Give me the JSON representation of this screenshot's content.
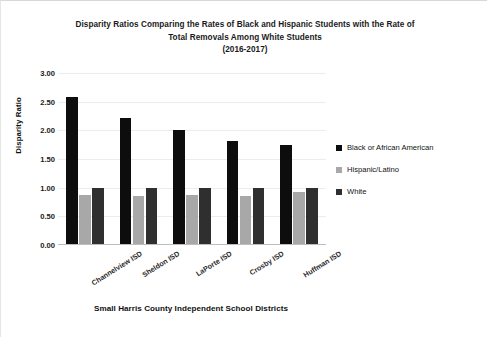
{
  "chart_data": {
    "type": "bar",
    "title": "Disparity Ratios Comparing the Rates of Black and Hispanic Students with the Rate of Total Removals Among White Students (2016-2017)",
    "title_lines": [
      "Disparity Ratios Comparing the Rates of Black and Hispanic Students with the Rate of",
      "Total Removals Among White Students",
      "(2016-2017)"
    ],
    "xlabel": "Small Harris County Independent School Districts",
    "ylabel": "Disparity Ratio",
    "ylim": [
      0.0,
      3.0
    ],
    "ytick_step": 0.5,
    "ytick_labels": [
      "0.00",
      "0.50",
      "1.00",
      "1.50",
      "2.00",
      "2.50",
      "3.00"
    ],
    "ytick_values": [
      0.0,
      0.5,
      1.0,
      1.5,
      2.0,
      2.5,
      3.0
    ],
    "grid": true,
    "legend_position": "right",
    "categories": [
      "Channelview ISD",
      "Sheldon ISD",
      "LaPorte ISD",
      "Crosby ISD",
      "Huffman ISD"
    ],
    "series": [
      {
        "name": "Black or African American",
        "color": "#0d0d0d",
        "values": [
          2.58,
          2.22,
          2.01,
          1.82,
          1.75
        ]
      },
      {
        "name": "Hispanic/Latino",
        "color": "#a8a8a8",
        "values": [
          0.87,
          0.85,
          0.88,
          0.85,
          0.92
        ]
      },
      {
        "name": "White",
        "color": "#2f2f2f",
        "values": [
          1.0,
          1.0,
          1.0,
          1.0,
          1.0
        ]
      }
    ]
  },
  "colors": {
    "series_black": "#0d0d0d",
    "series_hispanic": "#a8a8a8",
    "series_white": "#2f2f2f",
    "gridline": "#ececec",
    "axis": "#bdbdbd",
    "text": "#111111",
    "background": "#ffffff"
  }
}
